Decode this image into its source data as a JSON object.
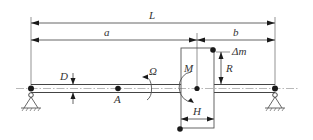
{
  "diagram": {
    "labels": {
      "L": "L",
      "a": "a",
      "b": "b",
      "delta_m": "Δm",
      "R": "R",
      "M": "M",
      "D": "D",
      "Q": "Ω",
      "A": "A",
      "H": "H"
    },
    "components": [
      "left pin support",
      "right pin support",
      "shaft",
      "disk",
      "unbalance mass",
      "point A"
    ],
    "colors": {
      "line": "#555555",
      "dot": "#1a1a1a",
      "text": "#333333",
      "background": "#ffffff"
    }
  }
}
